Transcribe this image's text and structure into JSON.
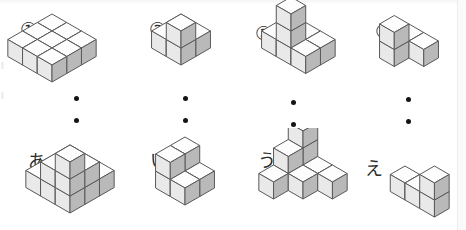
{
  "page": {
    "background_color": "#ffffff",
    "width": 466,
    "height": 230
  },
  "style": {
    "cube_top_color": "#fdfdfd",
    "cube_left_color": "#e9e9e9",
    "cube_right_color": "#b9b9b9",
    "cube_stroke_color": "#595959",
    "dot_color": "#141414",
    "label_color": "#2b2b2b",
    "frame_edge_color": "#ececec"
  },
  "separator_dots": {
    "count_per_column": 2,
    "label": "vertical-ellipsis"
  },
  "top_row": [
    {
      "id": "figure-1",
      "label": "①",
      "label_type": "circled-number",
      "origin": {
        "x": 52,
        "y": 14
      },
      "cube_size": 17,
      "label_pos": {
        "x": -32,
        "y": 6
      },
      "dots": [
        {
          "x": 22,
          "y": 82
        },
        {
          "x": 22,
          "y": 104
        }
      ],
      "cubes": [
        [
          0,
          0,
          0
        ],
        [
          1,
          0,
          0
        ],
        [
          2,
          0,
          0
        ],
        [
          0,
          1,
          0
        ],
        [
          1,
          1,
          0
        ],
        [
          2,
          1,
          0
        ],
        [
          0,
          2,
          0
        ],
        [
          1,
          2,
          0
        ],
        [
          2,
          2,
          0
        ]
      ]
    },
    {
      "id": "figure-2",
      "label": "②",
      "label_type": "circled-number",
      "origin": {
        "x": 181,
        "y": 14
      },
      "cube_size": 17,
      "label_pos": {
        "x": -32,
        "y": 6
      },
      "dots": [
        {
          "x": 2,
          "y": 82
        },
        {
          "x": 2,
          "y": 104
        }
      ],
      "cubes": [
        [
          0,
          0,
          0
        ],
        [
          1,
          0,
          0
        ],
        [
          0,
          1,
          0
        ],
        [
          1,
          1,
          0
        ],
        [
          1,
          1,
          1
        ]
      ]
    },
    {
      "id": "figure-3",
      "label": "③",
      "label_type": "circled-number",
      "origin": {
        "x": 291,
        "y": 14
      },
      "cube_size": 17,
      "label_pos": {
        "x": -36,
        "y": 10
      },
      "dots": [
        {
          "x": 0,
          "y": 86
        },
        {
          "x": 0,
          "y": 108
        }
      ],
      "cubes": [
        [
          0,
          0,
          0
        ],
        [
          1,
          0,
          0
        ],
        [
          2,
          0,
          0
        ],
        [
          0,
          1,
          0
        ],
        [
          1,
          1,
          0
        ],
        [
          2,
          1,
          0
        ],
        [
          1,
          1,
          1
        ],
        [
          1,
          1,
          2
        ]
      ]
    },
    {
      "id": "figure-4",
      "label": "④",
      "label_type": "circled-number",
      "origin": {
        "x": 409,
        "y": 24
      },
      "cube_size": 17,
      "label_pos": {
        "x": -34,
        "y": -2
      },
      "dots": [
        {
          "x": -3,
          "y": 73
        },
        {
          "x": -3,
          "y": 95
        }
      ],
      "cubes": [
        [
          0,
          0,
          0
        ],
        [
          1,
          0,
          0
        ],
        [
          0,
          1,
          0
        ],
        [
          0,
          1,
          1
        ]
      ]
    }
  ],
  "bottom_row": [
    {
      "id": "figure-a",
      "label": "あ",
      "label_type": "kana",
      "origin": {
        "x": 70,
        "y": 145
      },
      "cube_size": 17,
      "label_pos": {
        "x": -42,
        "y": 8
      },
      "cubes": [
        [
          0,
          0,
          0
        ],
        [
          1,
          0,
          0
        ],
        [
          2,
          0,
          0
        ],
        [
          0,
          1,
          0
        ],
        [
          1,
          1,
          0
        ],
        [
          2,
          1,
          0
        ],
        [
          0,
          2,
          0
        ],
        [
          1,
          2,
          0
        ],
        [
          2,
          2,
          0
        ],
        [
          1,
          1,
          1
        ],
        [
          2,
          1,
          1
        ],
        [
          1,
          2,
          1
        ],
        [
          2,
          2,
          1
        ],
        [
          2,
          2,
          2
        ]
      ]
    },
    {
      "id": "figure-i",
      "label": "い",
      "label_type": "kana",
      "origin": {
        "x": 185,
        "y": 154
      },
      "cube_size": 17,
      "label_pos": {
        "x": -35,
        "y": -2
      },
      "cubes": [
        [
          0,
          0,
          0
        ],
        [
          1,
          0,
          0
        ],
        [
          0,
          1,
          0
        ],
        [
          1,
          1,
          0
        ],
        [
          0,
          0,
          1
        ],
        [
          0,
          1,
          1
        ]
      ]
    },
    {
      "id": "figure-u",
      "label": "う",
      "label_type": "kana",
      "origin": {
        "x": 303,
        "y": 148
      },
      "cube_size": 17,
      "label_pos": {
        "x": -45,
        "y": 4
      },
      "cubes": [
        [
          0,
          0,
          0
        ],
        [
          1,
          0,
          0
        ],
        [
          2,
          0,
          0
        ],
        [
          0,
          1,
          0
        ],
        [
          1,
          1,
          0
        ],
        [
          0,
          2,
          0
        ],
        [
          0,
          1,
          1
        ],
        [
          0,
          0,
          1
        ],
        [
          0,
          0,
          2
        ]
      ]
    },
    {
      "id": "figure-e",
      "label": "え",
      "label_type": "kana",
      "origin": {
        "x": 405,
        "y": 166
      },
      "cube_size": 17,
      "label_pos": {
        "x": -40,
        "y": -6
      },
      "cubes": [
        [
          0,
          0,
          0
        ],
        [
          1,
          0,
          0
        ],
        [
          2,
          0,
          0
        ],
        [
          2,
          0,
          1
        ]
      ]
    }
  ]
}
